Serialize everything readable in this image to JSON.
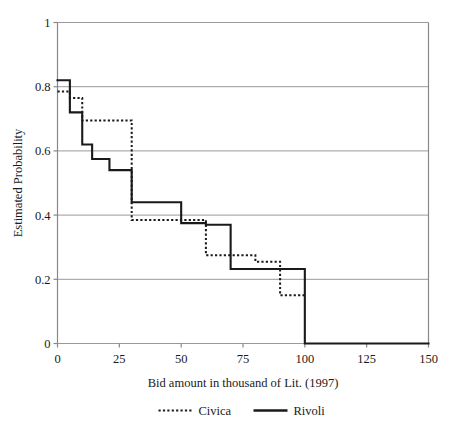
{
  "chart_data": {
    "type": "line",
    "subtype": "step-survival-function",
    "title": "",
    "xlabel": "Bid amount in thousand of Lit. (1997)",
    "ylabel": "Estimated Probability",
    "xlim": [
      0,
      150
    ],
    "ylim": [
      0,
      1
    ],
    "xticks": [
      0,
      25,
      50,
      75,
      100,
      125,
      150
    ],
    "xtick_labels": [
      "0",
      "25",
      "50",
      "75",
      "100",
      "125",
      "150"
    ],
    "yticks": [
      0,
      0.2,
      0.4,
      0.6,
      0.8,
      1
    ],
    "ytick_labels": [
      "0",
      "0.2",
      "0.4",
      "0.6",
      "0.8",
      "1"
    ],
    "grid": "horizontal",
    "legend_position": "below-xlabel",
    "series": [
      {
        "name": "Civica",
        "style": "dotted",
        "color": "#1a1a1a",
        "points": [
          {
            "x": 0,
            "y": 0.785
          },
          {
            "x": 5,
            "y": 0.785
          },
          {
            "x": 5,
            "y": 0.765
          },
          {
            "x": 10,
            "y": 0.765
          },
          {
            "x": 10,
            "y": 0.695
          },
          {
            "x": 30,
            "y": 0.695
          },
          {
            "x": 30,
            "y": 0.385
          },
          {
            "x": 60,
            "y": 0.385
          },
          {
            "x": 60,
            "y": 0.275
          },
          {
            "x": 80,
            "y": 0.275
          },
          {
            "x": 80,
            "y": 0.255
          },
          {
            "x": 90,
            "y": 0.255
          },
          {
            "x": 90,
            "y": 0.15
          },
          {
            "x": 100,
            "y": 0.15
          }
        ]
      },
      {
        "name": "Rivoli",
        "style": "solid",
        "color": "#1a1a1a",
        "points": [
          {
            "x": 0,
            "y": 0.82
          },
          {
            "x": 5,
            "y": 0.82
          },
          {
            "x": 5,
            "y": 0.72
          },
          {
            "x": 10,
            "y": 0.72
          },
          {
            "x": 10,
            "y": 0.62
          },
          {
            "x": 14,
            "y": 0.62
          },
          {
            "x": 14,
            "y": 0.575
          },
          {
            "x": 21,
            "y": 0.575
          },
          {
            "x": 21,
            "y": 0.54
          },
          {
            "x": 30,
            "y": 0.54
          },
          {
            "x": 30,
            "y": 0.44
          },
          {
            "x": 50,
            "y": 0.44
          },
          {
            "x": 50,
            "y": 0.375
          },
          {
            "x": 60,
            "y": 0.375
          },
          {
            "x": 60,
            "y": 0.37
          },
          {
            "x": 70,
            "y": 0.37
          },
          {
            "x": 70,
            "y": 0.232
          },
          {
            "x": 100,
            "y": 0.232
          },
          {
            "x": 100,
            "y": 0.0
          },
          {
            "x": 150,
            "y": 0.0
          }
        ]
      }
    ]
  },
  "legend": {
    "items": [
      {
        "label": "Civica",
        "style": "dotted"
      },
      {
        "label": "Rivoli",
        "style": "solid"
      }
    ]
  },
  "colors": {
    "ink": "#1a1a1a",
    "grid": "#999999",
    "axis": "#888888",
    "background": "#ffffff"
  }
}
